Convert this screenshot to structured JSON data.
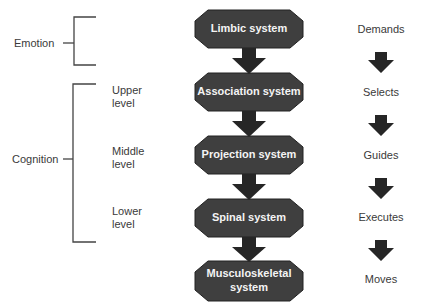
{
  "left": {
    "emotion": {
      "label": "Emotion"
    },
    "cognition": {
      "label": "Cognition",
      "levels": [
        {
          "line1": "Upper",
          "line2": "level"
        },
        {
          "line1": "Middle",
          "line2": "level"
        },
        {
          "line1": "Lower",
          "line2": "level"
        }
      ]
    }
  },
  "center": {
    "boxes": [
      {
        "line1": "Limbic system"
      },
      {
        "line1": "Association system"
      },
      {
        "line1": "Projection system"
      },
      {
        "line1": "Spinal system"
      },
      {
        "line1": "Musculoskeletal",
        "line2": "system"
      }
    ]
  },
  "right": {
    "verbs": [
      "Demands",
      "Selects",
      "Guides",
      "Executes",
      "Moves"
    ]
  },
  "colors": {
    "box_fill": "#3f3f3f",
    "arrow_fill": "#262626",
    "line": "#444444"
  }
}
